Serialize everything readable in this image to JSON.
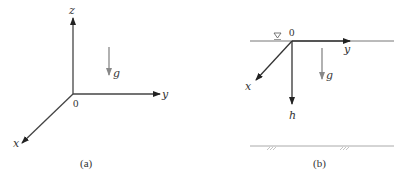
{
  "panel_a": {
    "caption": "(a)",
    "origin_label": "0",
    "axes": {
      "z_label": "z",
      "y_label": "y",
      "x_label": "x"
    },
    "gravity_label": "g"
  },
  "panel_b": {
    "caption": "(b)",
    "origin_label": "0",
    "water_surface_symbol": "▽",
    "axes": {
      "y_label": "y",
      "x_label": "x",
      "h_label": "h"
    },
    "gravity_label": "g"
  },
  "colors": {
    "axis": "#222222",
    "gravity": "#888888",
    "surface": "#777777",
    "bed": "#aaaaaa"
  }
}
